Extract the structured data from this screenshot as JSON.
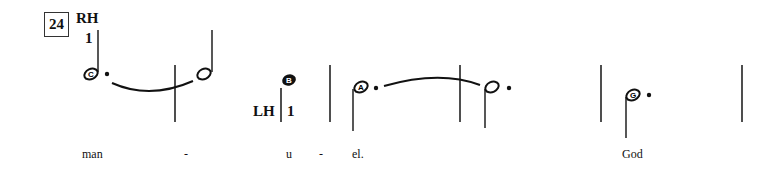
{
  "measure_number": "24",
  "hands": {
    "right": {
      "label": "RH",
      "finger": "1"
    },
    "left": {
      "label": "LH",
      "finger": "1"
    }
  },
  "notes": [
    {
      "letter": "C",
      "type": "dotted-half",
      "stem": "up",
      "tie_to_next": true
    },
    {
      "letter": "",
      "type": "half",
      "stem": "up"
    },
    {
      "letter": "B",
      "type": "quarter",
      "stem": "down"
    },
    {
      "letter": "A",
      "type": "dotted-half",
      "stem": "down",
      "tie_to_next": true
    },
    {
      "letter": "",
      "type": "dotted-half",
      "stem": "down"
    },
    {
      "letter": "G",
      "type": "dotted-half",
      "stem": "down"
    }
  ],
  "lyrics": [
    {
      "text": "man"
    },
    {
      "text": "-"
    },
    {
      "text": "u"
    },
    {
      "text": "-"
    },
    {
      "text": "el."
    },
    {
      "text": "God"
    }
  ]
}
